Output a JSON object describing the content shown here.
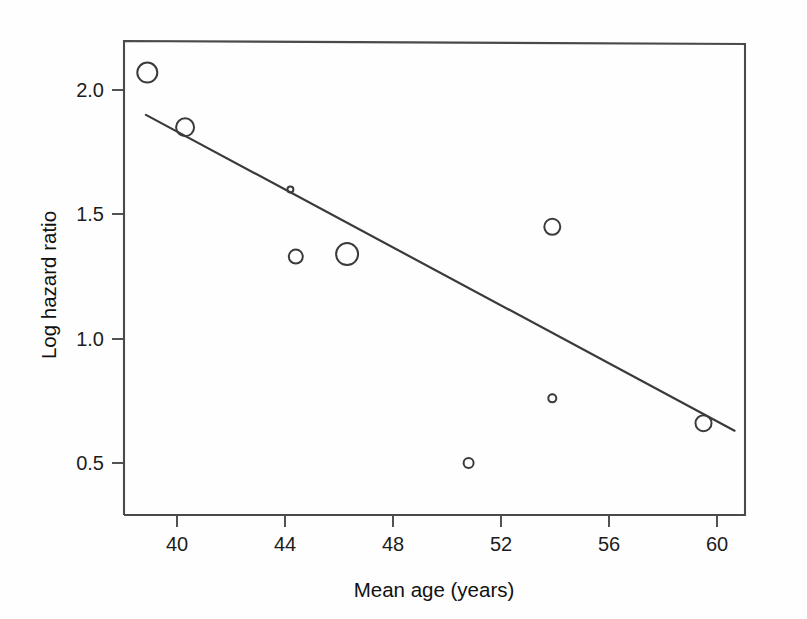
{
  "figure": {
    "background_color": "#fefefe",
    "line_color": "#3a3a3a",
    "marker_color": "#3b3b3b"
  },
  "chart_data": {
    "type": "scatter",
    "title": "",
    "subtitle": "",
    "xlabel": "Mean age (years)",
    "ylabel": "Log hazard ratio",
    "xlim": [
      38.0,
      61.0
    ],
    "ylim": [
      0.29,
      2.21
    ],
    "xticks": [
      40,
      44,
      48,
      52,
      56,
      60
    ],
    "xtick_labels": [
      "40",
      "44",
      "48",
      "52",
      "56",
      "60"
    ],
    "yticks": [
      0.5,
      1.0,
      1.5,
      2.0
    ],
    "ytick_labels": [
      "0.5",
      "1.0",
      "1.5",
      "2.0"
    ],
    "grid": false,
    "legend": null,
    "annotations": [],
    "marker_style": "open-circle",
    "marker_size_meaning": "study weight (inverse variance)",
    "points": [
      {
        "x": 38.9,
        "y": 2.07,
        "size": 10
      },
      {
        "x": 40.3,
        "y": 1.85,
        "size": 9
      },
      {
        "x": 44.2,
        "y": 1.6,
        "size": 3
      },
      {
        "x": 44.4,
        "y": 1.33,
        "size": 7
      },
      {
        "x": 46.3,
        "y": 1.34,
        "size": 11
      },
      {
        "x": 50.8,
        "y": 0.5,
        "size": 5
      },
      {
        "x": 53.9,
        "y": 1.45,
        "size": 8
      },
      {
        "x": 53.9,
        "y": 0.76,
        "size": 4
      },
      {
        "x": 59.5,
        "y": 0.66,
        "size": 8
      }
    ],
    "series": [
      {
        "name": "studies",
        "x": [
          38.9,
          40.3,
          44.2,
          44.4,
          46.3,
          50.8,
          53.9,
          53.9,
          59.5
        ],
        "values": [
          2.07,
          1.85,
          1.6,
          1.33,
          1.34,
          0.5,
          1.45,
          0.76,
          0.66
        ]
      }
    ],
    "regression_line": {
      "name": "meta-regression fit",
      "x_start": 38.85,
      "y_start": 1.9,
      "x_end": 60.65,
      "y_end": 0.63,
      "slope": -0.0583,
      "intercept": 4.164
    }
  }
}
